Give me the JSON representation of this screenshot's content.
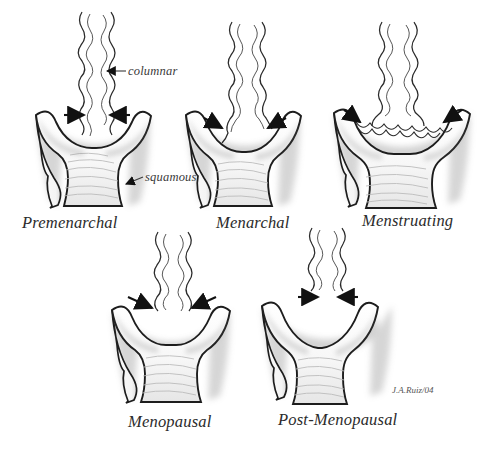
{
  "figure": {
    "signature": "J.A.Ruiz/04",
    "background_color": "#ffffff",
    "ink_color": "#1d1d1d",
    "wash_color": "#d8d8d8"
  },
  "annotations": [
    {
      "label": "columnar",
      "x": 128,
      "y": 72
    },
    {
      "label": "squamous",
      "x": 145,
      "y": 178
    }
  ],
  "panels": [
    {
      "id": "premenarchal",
      "caption": "Premenarchal",
      "caption_x": 22,
      "caption_y": 213,
      "junction_position": "at external os",
      "arrows": 2
    },
    {
      "id": "menarchal",
      "caption": "Menarchal",
      "caption_x": 216,
      "caption_y": 213,
      "junction_position": "onto inner ectocervix",
      "arrows": 2
    },
    {
      "id": "menstruating",
      "caption": "Menstruating",
      "caption_x": 362,
      "caption_y": 211,
      "junction_position": "maximal eversion on ectocervix",
      "arrows": 2
    },
    {
      "id": "menopausal",
      "caption": "Menopausal",
      "caption_x": 128,
      "caption_y": 412,
      "junction_position": "receding into canal",
      "arrows": 2
    },
    {
      "id": "post-menopausal",
      "caption": "Post-Menopausal",
      "caption_x": 278,
      "caption_y": 410,
      "junction_position": "high within endocervical canal",
      "arrows": 2
    }
  ]
}
